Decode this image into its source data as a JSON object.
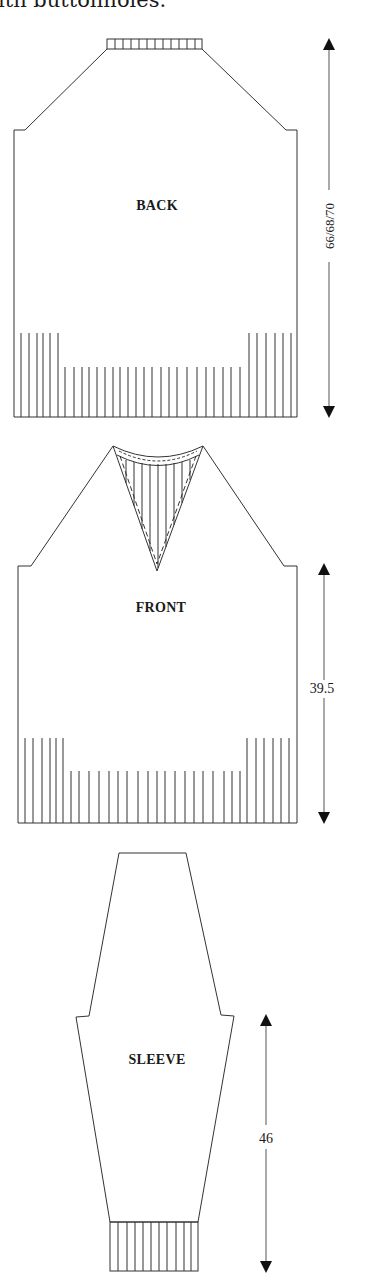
{
  "caption": "ith buttonholes.",
  "pieces": {
    "back": {
      "label": "BACK",
      "measurement": "66/68/70"
    },
    "front": {
      "label": "FRONT",
      "measurement": "39.5"
    },
    "sleeve": {
      "label": "SLEEVE",
      "measurement": "46"
    }
  },
  "colors": {
    "line": "#333333",
    "background": "#ffffff"
  }
}
